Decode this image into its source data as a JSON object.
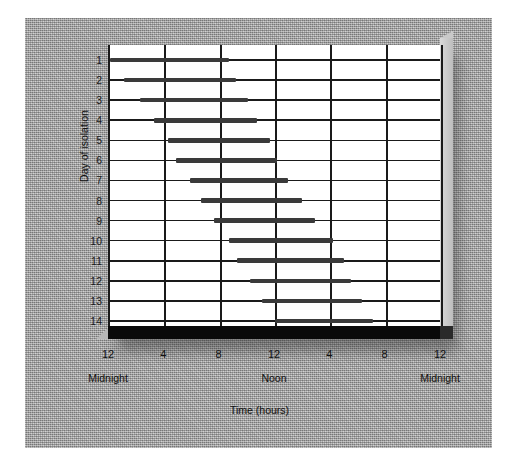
{
  "chart_data": {
    "type": "bar",
    "orientation": "horizontal",
    "title": "",
    "xlabel": "Time (hours)",
    "ylabel": "Day of isolation",
    "xlim": [
      0,
      24
    ],
    "ylim_categories": [
      "1",
      "2",
      "3",
      "4",
      "5",
      "6",
      "7",
      "8",
      "9",
      "10",
      "11",
      "12",
      "13",
      "14"
    ],
    "grid": true,
    "legend": null,
    "x_tick_values": [
      0,
      4,
      8,
      12,
      16,
      20,
      24
    ],
    "x_tick_labels": [
      "12",
      "4",
      "8",
      "12",
      "4",
      "8",
      "12"
    ],
    "x_sub_labels": [
      {
        "value": 0,
        "label": "Midnight"
      },
      {
        "value": 12,
        "label": "Noon"
      },
      {
        "value": 24,
        "label": "Midnight"
      }
    ],
    "bar_color": "#3a3a3a",
    "series": [
      {
        "name": "Sleep episode",
        "description": "Free-running rest interval, onset drifts later each day",
        "intervals": [
          {
            "day": "1",
            "start": 0.0,
            "end": 8.6
          },
          {
            "day": "2",
            "start": 1.0,
            "end": 9.1
          },
          {
            "day": "3",
            "start": 2.2,
            "end": 10.0
          },
          {
            "day": "4",
            "start": 3.2,
            "end": 10.6
          },
          {
            "day": "5",
            "start": 4.2,
            "end": 11.6
          },
          {
            "day": "6",
            "start": 4.8,
            "end": 12.1
          },
          {
            "day": "7",
            "start": 5.8,
            "end": 12.9
          },
          {
            "day": "8",
            "start": 6.6,
            "end": 13.9
          },
          {
            "day": "9",
            "start": 7.5,
            "end": 14.8
          },
          {
            "day": "10",
            "start": 8.6,
            "end": 16.1
          },
          {
            "day": "11",
            "start": 9.2,
            "end": 16.9
          },
          {
            "day": "12",
            "start": 10.1,
            "end": 17.4
          },
          {
            "day": "13",
            "start": 11.0,
            "end": 18.2
          },
          {
            "day": "14",
            "start": 11.9,
            "end": 19.0
          }
        ]
      }
    ]
  },
  "axes": {
    "y_title": "Day of isolation",
    "x_title": "Time (hours)"
  }
}
